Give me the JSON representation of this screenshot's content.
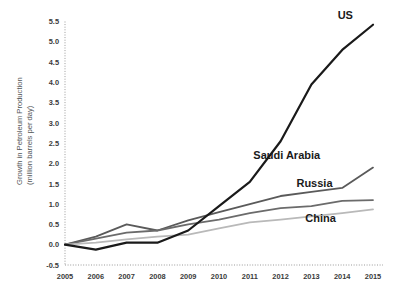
{
  "chart_data": {
    "type": "line",
    "title": "",
    "subtitle": "",
    "xlabel": "",
    "ylabel": "Growth in Petroleum Production (million barrels per day)",
    "ylabel_line1": "Growth in Petroleum Production",
    "ylabel_line2": "(million barrels per day)",
    "x": [
      2005,
      2006,
      2007,
      2008,
      2009,
      2010,
      2011,
      2012,
      2013,
      2014,
      2015
    ],
    "categories": [
      "2005",
      "2006",
      "2007",
      "2008",
      "2009",
      "2010",
      "2011",
      "2012",
      "2013",
      "2014",
      "2015"
    ],
    "xlim": [
      2005,
      2015
    ],
    "ylim": [
      -0.5,
      5.5
    ],
    "yticks": [
      -0.5,
      0.0,
      0.5,
      1.0,
      1.5,
      2.0,
      2.5,
      3.0,
      3.5,
      4.0,
      4.5,
      5.0,
      5.5
    ],
    "ytick_labels": [
      "-0.5",
      "0.0",
      "0.5",
      "1.0",
      "1.5",
      "2.0",
      "2.5",
      "3.0",
      "3.5",
      "4.0",
      "4.5",
      "5.0",
      "5.5"
    ],
    "grid": false,
    "axis_style": "dotted",
    "legend": "inline-end-of-line",
    "series": [
      {
        "name": "US",
        "color": "#1a1a1a",
        "width": 2.2,
        "values": [
          0.0,
          -0.12,
          0.05,
          0.05,
          0.35,
          0.95,
          1.55,
          2.55,
          3.95,
          4.8,
          5.42
        ],
        "label": "US",
        "label_x": 2014.1,
        "label_y": 5.55
      },
      {
        "name": "Saudi Arabia",
        "color": "#5a5a5a",
        "width": 1.8,
        "values": [
          0.0,
          0.2,
          0.5,
          0.35,
          0.6,
          0.8,
          1.0,
          1.2,
          1.3,
          1.4,
          1.9
        ],
        "label": "Saudi Arabia",
        "label_x": 2012.2,
        "label_y": 2.12
      },
      {
        "name": "Russia",
        "color": "#6b6b6b",
        "width": 1.8,
        "values": [
          0.0,
          0.15,
          0.3,
          0.35,
          0.5,
          0.62,
          0.78,
          0.9,
          0.95,
          1.08,
          1.1
        ],
        "label": "Russia",
        "label_x": 2013.1,
        "label_y": 1.42
      },
      {
        "name": "China",
        "color": "#b9b9b9",
        "width": 1.8,
        "values": [
          0.0,
          0.05,
          0.13,
          0.2,
          0.25,
          0.4,
          0.55,
          0.62,
          0.7,
          0.78,
          0.87
        ],
        "label": "China",
        "label_x": 2013.3,
        "label_y": 0.55
      }
    ]
  }
}
